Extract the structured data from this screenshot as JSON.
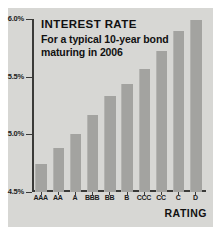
{
  "chart_data": {
    "type": "bar",
    "title": "INTEREST RATE",
    "subtitle": "For a typical 10-year bond maturing in 2006",
    "xlabel": "RATING",
    "ylabel": "",
    "categories": [
      "AAA",
      "AA",
      "A",
      "BBB",
      "BB",
      "B",
      "CCC",
      "CC",
      "C",
      "D"
    ],
    "values": [
      4.74,
      4.88,
      5.0,
      5.17,
      5.33,
      5.44,
      5.57,
      5.72,
      5.9,
      5.99
    ],
    "ylim": [
      4.5,
      6.0
    ],
    "ytick_values": [
      6.0,
      5.5,
      5.0,
      4.5
    ],
    "ytick_labels": [
      "6.0%",
      "5.5%",
      "5.0%",
      "4.5%"
    ],
    "grid": false,
    "legend": false,
    "bar_color": "#a3a3a0",
    "background_color": "#d7d7d4",
    "axis_color": "#3a3a38",
    "text_color": "#111111"
  }
}
